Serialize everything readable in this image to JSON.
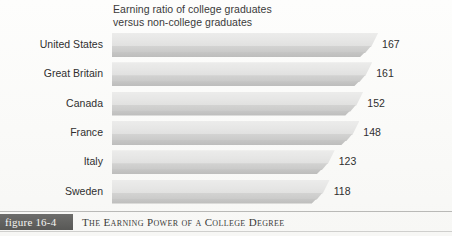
{
  "figure": {
    "badge_label": "figure 16-4",
    "caption": "The Earning Power of a College Degree"
  },
  "chart_data": {
    "type": "bar",
    "orientation": "horizontal",
    "title": "Earning ratio of college graduates\nversus non-college graduates",
    "xlabel": "",
    "ylabel": "",
    "grid": false,
    "legend": false,
    "categories": [
      "United States",
      "Great Britain",
      "Canada",
      "France",
      "Italy",
      "Sweden"
    ],
    "values": [
      167,
      161,
      152,
      148,
      123,
      118
    ],
    "value_labels": [
      "167",
      "161",
      "152",
      "148",
      "123",
      "118"
    ],
    "xlim": [
      100,
      175
    ],
    "bar_style": "3d-beveled",
    "bar_color": "#e3e3e2",
    "bar_base_color": "#c2c2c1"
  }
}
